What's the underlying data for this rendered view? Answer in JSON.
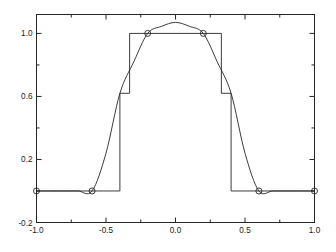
{
  "chart_data": {
    "type": "line",
    "title": "",
    "subtitle": "",
    "xlabel": "",
    "ylabel": "",
    "xlim": [
      -1.0,
      1.0
    ],
    "ylim": [
      -0.2,
      1.12
    ],
    "grid": false,
    "legend": null,
    "xticks": [
      -1.0,
      -0.5,
      0.0,
      0.5,
      1.0
    ],
    "xtick_labels": [
      "-1.0",
      "-0.5",
      "0.0",
      "0.5",
      "1.0"
    ],
    "yticks": [
      1.0,
      0.6,
      0.2,
      -0.2
    ],
    "ytick_labels": [
      "1.0",
      "0.6",
      "0.2",
      "-0.2"
    ],
    "y_minor_ticks": [
      0.8,
      0.4,
      0.0
    ],
    "x_minor_ticks": [
      -0.75,
      -0.25,
      0.25,
      0.75
    ],
    "series": [
      {
        "name": "square pulse",
        "style": "step",
        "color": "#262626",
        "x": [
          -1.0,
          -0.4,
          -0.4,
          -0.33,
          -0.33,
          0.33,
          0.33,
          0.4,
          0.4,
          1.0
        ],
        "y": [
          0.0,
          0.0,
          0.62,
          0.62,
          1.0,
          1.0,
          0.62,
          0.62,
          0.0,
          0.0
        ]
      },
      {
        "name": "interpolating curve",
        "style": "smooth",
        "color": "#262626",
        "x": [
          -1.0,
          -0.9,
          -0.8,
          -0.7,
          -0.6,
          -0.5,
          -0.4,
          -0.3,
          -0.2,
          -0.1,
          0.0,
          0.1,
          0.2,
          0.3,
          0.4,
          0.5,
          0.6,
          0.7,
          0.8,
          0.9,
          1.0
        ],
        "y": [
          0.0,
          0.0,
          0.0,
          0.0,
          0.0,
          0.24,
          0.62,
          0.82,
          1.0,
          1.045,
          1.07,
          1.045,
          1.0,
          0.82,
          0.62,
          0.24,
          0.0,
          0.0,
          0.0,
          0.0,
          0.0
        ]
      }
    ],
    "markers": {
      "name": "sample points",
      "shape": "circle-open",
      "color": "#262626",
      "x": [
        -1.0,
        -0.6,
        -0.2,
        0.2,
        0.6,
        1.0
      ],
      "y": [
        0.0,
        0.0,
        1.0,
        1.0,
        0.0,
        0.0
      ]
    }
  }
}
